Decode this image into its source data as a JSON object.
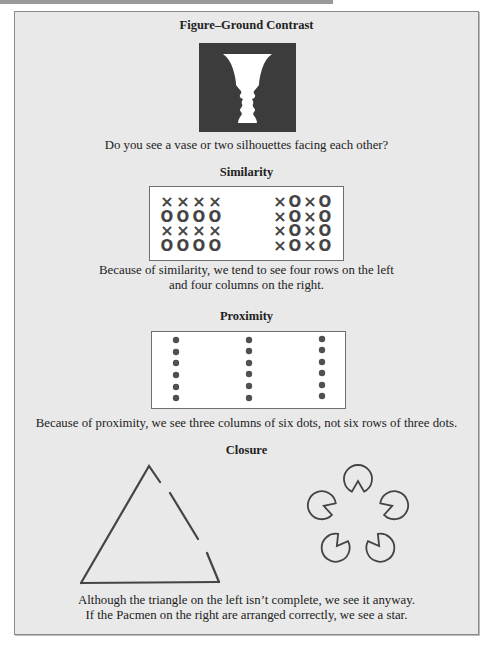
{
  "sections": {
    "figure_ground": {
      "title": "Figure–Ground Contrast",
      "image": "rubin-vase-silhouettes",
      "caption": "Do you see a vase or two silhouettes facing each other?"
    },
    "similarity": {
      "title": "Similarity",
      "left_grid": [
        [
          "×",
          "×",
          "×",
          "×"
        ],
        [
          "O",
          "O",
          "O",
          "O"
        ],
        [
          "×",
          "×",
          "×",
          "×"
        ],
        [
          "O",
          "O",
          "O",
          "O"
        ]
      ],
      "right_grid": [
        [
          "×",
          "O",
          "×",
          "O"
        ],
        [
          "×",
          "O",
          "×",
          "O"
        ],
        [
          "×",
          "O",
          "×",
          "O"
        ],
        [
          "×",
          "O",
          "×",
          "O"
        ]
      ],
      "caption_line1": "Because of similarity, we tend to see four rows on the left",
      "caption_line2": "and four columns on the right."
    },
    "proximity": {
      "title": "Proximity",
      "columns": 3,
      "dots_per_column": 6,
      "caption": "Because of proximity, we see three columns of six dots, not six rows of three dots."
    },
    "closure": {
      "title": "Closure",
      "left_figure": "incomplete-triangle",
      "right_figure": "pacmen-star",
      "pacmen_count": 5,
      "caption_line1": "Although the triangle on the left isn’t complete, we see it anyway.",
      "caption_line2": "If the Pacmen on the right are arranged correctly, we see a star."
    }
  },
  "colors": {
    "page_bg": "#e9e9e9",
    "ink": "#444444",
    "vase_bg": "#3c3c3c",
    "vase_fg": "#ffffff"
  }
}
